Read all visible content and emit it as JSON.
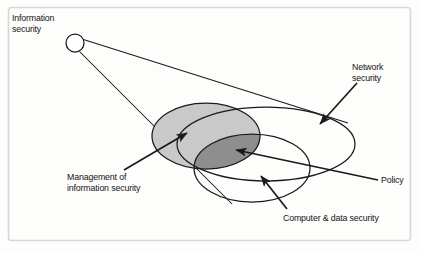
{
  "figure": {
    "frame": {
      "border_color": "#d8d8d6",
      "background": "#fdfdfc"
    }
  },
  "labels": {
    "information_security": "Information\nsecurity",
    "network_security": "Network\nsecurity",
    "management_of_information_security": "Management of\ninformation security",
    "policy": "Policy",
    "computer_and_data_security": "Computer & data security"
  },
  "shapes": {
    "node_circle": {
      "name": "information-security-node",
      "cx": 75,
      "cy": 43,
      "r": 9
    },
    "ellipse_network_security": {
      "name": "network-security-ellipse",
      "cx": 266,
      "cy": 144,
      "rx": 89,
      "ry": 37,
      "fill": "none",
      "stroke": "#1a1a1a"
    },
    "ellipse_management": {
      "name": "management-of-information-security-ellipse",
      "cx": 206,
      "cy": 136,
      "rx": 54,
      "ry": 33,
      "fill": "#c9c9c9",
      "stroke": "#1a1a1a"
    },
    "ellipse_computer_data": {
      "name": "computer-and-data-security-ellipse",
      "cx": 252,
      "cy": 168,
      "rx": 58,
      "ry": 34,
      "fill": "none",
      "stroke": "#1a1a1a"
    },
    "overlap_region": {
      "name": "policy-overlap-region",
      "fill": "#8e8e8e",
      "description": "intersection of management ellipse and computer & data security ellipse"
    }
  },
  "connectors": [
    {
      "name": "cone-line-upper",
      "from": "information-security-node",
      "to": "network-security-ellipse-upper-tangent"
    },
    {
      "name": "cone-line-lower",
      "from": "information-security-node",
      "to": "network-security-ellipse-lower-tangent"
    },
    {
      "name": "arrow-management",
      "from": "management-label",
      "to": "management-ellipse",
      "arrowhead": true
    },
    {
      "name": "arrow-network",
      "from": "network-label",
      "to": "network-ellipse",
      "arrowhead": true
    },
    {
      "name": "arrow-policy",
      "from": "policy-label",
      "to": "overlap-region",
      "arrowhead": true
    },
    {
      "name": "arrow-computer-data",
      "from": "computer-data-label",
      "to": "computer-data-ellipse",
      "arrowhead": true
    }
  ],
  "colors": {
    "ink": "#1a1a1a",
    "light_fill": "#c9c9c9",
    "dark_fill": "#8e8e8e",
    "frame": "#d8d8d6"
  }
}
